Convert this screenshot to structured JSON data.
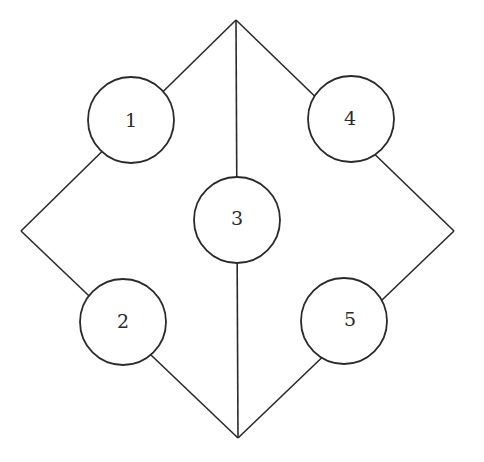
{
  "diagram": {
    "type": "graph",
    "vertices": {
      "top": {
        "x": 236,
        "y": 20
      },
      "left": {
        "x": 21,
        "y": 231
      },
      "right": {
        "x": 454,
        "y": 231
      },
      "bottom": {
        "x": 238,
        "y": 438
      }
    },
    "nodes": [
      {
        "id": "1",
        "label": "1",
        "cx": 131,
        "cy": 120,
        "r": 43,
        "tx": 131,
        "ty": 120
      },
      {
        "id": "2",
        "label": "2",
        "cx": 123,
        "cy": 322,
        "r": 43,
        "tx": 123,
        "ty": 321
      },
      {
        "id": "3",
        "label": "3",
        "cx": 237,
        "cy": 220,
        "r": 43,
        "tx": 237,
        "ty": 218
      },
      {
        "id": "4",
        "label": "4",
        "cx": 351,
        "cy": 119,
        "r": 43,
        "tx": 350,
        "ty": 118
      },
      {
        "id": "5",
        "label": "5",
        "cx": 344,
        "cy": 321,
        "r": 43,
        "tx": 350,
        "ty": 319
      }
    ],
    "edges": [
      {
        "from": "top",
        "to": "left",
        "via": "1"
      },
      {
        "from": "left",
        "to": "bottom",
        "via": "2"
      },
      {
        "from": "top",
        "to": "bottom",
        "via": "3"
      },
      {
        "from": "top",
        "to": "right",
        "via": "4"
      },
      {
        "from": "right",
        "to": "bottom",
        "via": "5"
      }
    ],
    "colors": {
      "stroke": "#2a2a2a",
      "background": "#ffffff"
    }
  }
}
